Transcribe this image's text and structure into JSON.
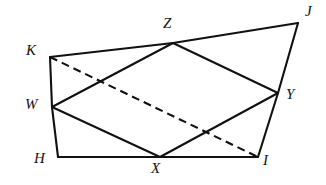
{
  "figure": {
    "canvas": {
      "width": 326,
      "height": 185
    },
    "stroke_color": "#111111",
    "background_color": "#ffffff",
    "vertices": [
      {
        "id": "K",
        "label": "K",
        "x": 50,
        "y": 57,
        "label_x": 26,
        "label_y": 43
      },
      {
        "id": "Z",
        "label": "Z",
        "x": 173,
        "y": 43,
        "label_x": 163,
        "label_y": 16
      },
      {
        "id": "J",
        "label": "J",
        "x": 298,
        "y": 23,
        "label_x": 305,
        "label_y": 4
      },
      {
        "id": "Y",
        "label": "Y",
        "x": 278,
        "y": 93,
        "label_x": 286,
        "label_y": 87
      },
      {
        "id": "I",
        "label": "I",
        "x": 258,
        "y": 157,
        "label_x": 263,
        "label_y": 153
      },
      {
        "id": "X",
        "label": "X",
        "x": 160,
        "y": 157,
        "label_x": 151,
        "label_y": 161
      },
      {
        "id": "H",
        "label": "H",
        "x": 58,
        "y": 157,
        "label_x": 34,
        "label_y": 151
      },
      {
        "id": "W",
        "label": "W",
        "x": 52,
        "y": 107,
        "label_x": 25,
        "label_y": 97
      }
    ],
    "edges": [
      {
        "name": "edge-K-Z",
        "from": "K",
        "to": "Z",
        "style": "solid"
      },
      {
        "name": "edge-Z-J",
        "from": "Z",
        "to": "J",
        "style": "solid"
      },
      {
        "name": "edge-J-Y",
        "from": "J",
        "to": "Y",
        "style": "solid"
      },
      {
        "name": "edge-Y-I",
        "from": "Y",
        "to": "I",
        "style": "solid"
      },
      {
        "name": "edge-I-X",
        "from": "I",
        "to": "X",
        "style": "solid"
      },
      {
        "name": "edge-X-H",
        "from": "X",
        "to": "H",
        "style": "solid"
      },
      {
        "name": "edge-H-W",
        "from": "H",
        "to": "W",
        "style": "solid"
      },
      {
        "name": "edge-W-K",
        "from": "W",
        "to": "K",
        "style": "solid"
      },
      {
        "name": "edge-W-Z",
        "from": "W",
        "to": "Z",
        "style": "solid"
      },
      {
        "name": "edge-Z-Y",
        "from": "Z",
        "to": "Y",
        "style": "solid"
      },
      {
        "name": "edge-Y-X",
        "from": "Y",
        "to": "X",
        "style": "solid"
      },
      {
        "name": "edge-X-W",
        "from": "X",
        "to": "W",
        "style": "solid"
      },
      {
        "name": "edge-K-I-diagonal",
        "from": "K",
        "to": "I",
        "style": "dashed"
      }
    ]
  }
}
